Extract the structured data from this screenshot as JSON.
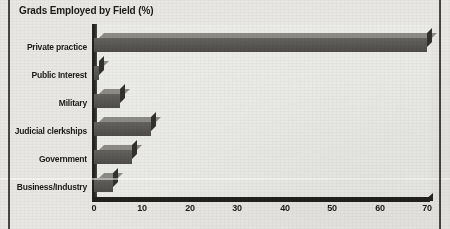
{
  "chart_data": {
    "type": "bar",
    "orientation": "horizontal",
    "title": "Grads Employed by Field (%)",
    "xlabel": "",
    "ylabel": "",
    "categories": [
      "Private practice",
      "Public Interest",
      "Military",
      "Judicial clerkships",
      "Government",
      "Business/Industry"
    ],
    "values": [
      70,
      1,
      5.5,
      12,
      8,
      4
    ],
    "xlim": [
      0,
      70
    ],
    "xticks": [
      0,
      10,
      20,
      30,
      40,
      50,
      60,
      70
    ],
    "xtick_labels": [
      "0",
      "10",
      "20",
      "30",
      "40",
      "50",
      "60",
      "70"
    ],
    "grid": false,
    "legend": false,
    "style": "3d-bar",
    "colors": {
      "bar_front": "#5d5b57",
      "bar_top": "#8d8b86",
      "bar_side": "#33312e",
      "axis": "#23211f",
      "background": "#e8e7e3",
      "text": "#1d1c1b"
    }
  },
  "page": {
    "rules": [
      "left-column-rule",
      "right-column-rule"
    ]
  }
}
